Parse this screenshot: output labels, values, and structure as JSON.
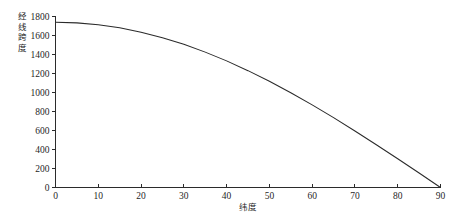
{
  "chart_data": {
    "type": "line",
    "title": "",
    "subtitle": "",
    "xlabel": "纬度",
    "ylabel": "经线跨度",
    "xlim": [
      0,
      90
    ],
    "ylim": [
      0,
      1800
    ],
    "grid": false,
    "legend": null,
    "legend_position": "none",
    "x_ticks": [
      0,
      10,
      20,
      30,
      40,
      50,
      60,
      70,
      80,
      90
    ],
    "x_tick_labels": [
      "0",
      "10",
      "20",
      "30",
      "40",
      "50",
      "60",
      "70",
      "80",
      "90"
    ],
    "y_ticks": [
      0,
      200,
      400,
      600,
      800,
      1000,
      1200,
      1400,
      1600,
      1800
    ],
    "y_tick_labels": [
      "0",
      "200",
      "400",
      "600",
      "800",
      "1000",
      "1200",
      "1400",
      "1600",
      "1800"
    ],
    "x": [
      0,
      5,
      10,
      15,
      20,
      25,
      30,
      35,
      40,
      45,
      50,
      55,
      60,
      65,
      70,
      75,
      80,
      85,
      90
    ],
    "values": [
      1740,
      1733,
      1713,
      1681,
      1635,
      1577,
      1507,
      1425,
      1333,
      1230,
      1118,
      998,
      870,
      735,
      595,
      450,
      302,
      152,
      0
    ],
    "series": [
      {
        "name": "经线跨度",
        "color": "#2a2a2a",
        "x": [
          0,
          5,
          10,
          15,
          20,
          25,
          30,
          35,
          40,
          45,
          50,
          55,
          60,
          65,
          70,
          75,
          80,
          85,
          90
        ],
        "values": [
          1740,
          1733,
          1713,
          1681,
          1635,
          1577,
          1507,
          1425,
          1333,
          1230,
          1118,
          998,
          870,
          735,
          595,
          450,
          302,
          152,
          0
        ]
      }
    ],
    "annotations": []
  },
  "ylabel_chars": [
    "经",
    "线",
    "跨",
    "度"
  ],
  "colors": {
    "curve": "#2a2a2a",
    "axis": "#2b2b2b",
    "text": "#1f1f1f",
    "background": "#ffffff"
  }
}
